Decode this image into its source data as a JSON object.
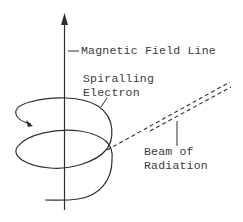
{
  "diagram": {
    "labels": {
      "field_line": "Magnetic Field Line",
      "electron_line1": "Spiralling",
      "electron_line2": "Electron",
      "beam_line1": "Beam of",
      "beam_line2": "Radiation"
    },
    "colors": {
      "ink": "#2e2e2e",
      "background": "#ffffff"
    }
  }
}
